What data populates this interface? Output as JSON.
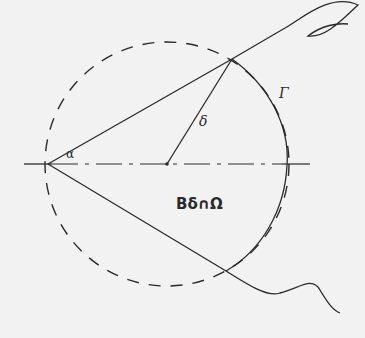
{
  "diagram": {
    "labels": {
      "alpha": "α",
      "delta": "δ",
      "gamma": "Γ",
      "region": "Bδ∩Ω"
    },
    "colors": {
      "background": "#f2f2f2",
      "stroke": "#2a2a2a"
    },
    "geometry": {
      "vertex": [
        48,
        164
      ],
      "center": [
        167,
        164
      ],
      "radius": 122,
      "upper_intersection": [
        232,
        59
      ],
      "lower_intersection": [
        226,
        271
      ]
    }
  }
}
